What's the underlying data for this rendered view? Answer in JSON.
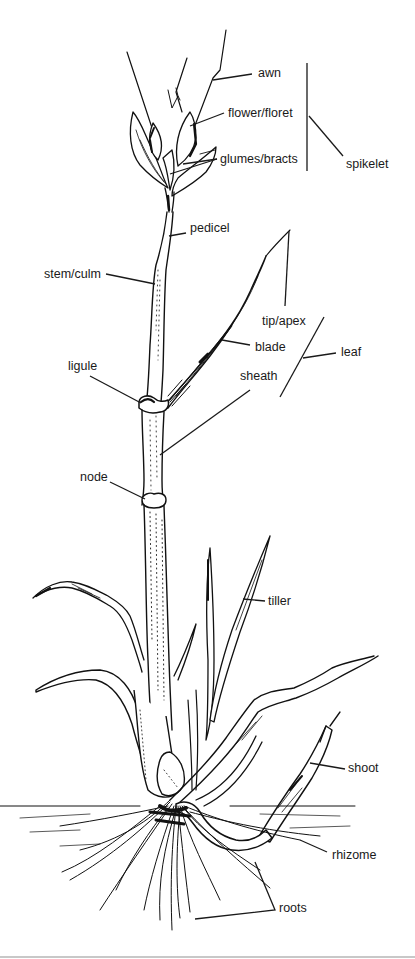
{
  "colors": {
    "ink": "#111111",
    "background": "#ffffff",
    "label": "#1a1a1a"
  },
  "labels": {
    "awn": "awn",
    "flower_floret": "flower/floret",
    "glumes_bracts": "glumes/bracts",
    "spikelet": "spikelet",
    "pedicel": "pedicel",
    "stem_culm": "stem/culm",
    "tip_apex": "tip/apex",
    "blade": "blade",
    "leaf": "leaf",
    "ligule": "ligule",
    "sheath": "sheath",
    "node": "node",
    "tiller": "tiller",
    "shoot": "shoot",
    "rhizome": "rhizome",
    "roots": "roots"
  },
  "groups": {
    "spikelet": [
      "awn",
      "flower/floret",
      "glumes/bracts"
    ],
    "leaf": [
      "tip/apex",
      "blade",
      "sheath"
    ]
  }
}
